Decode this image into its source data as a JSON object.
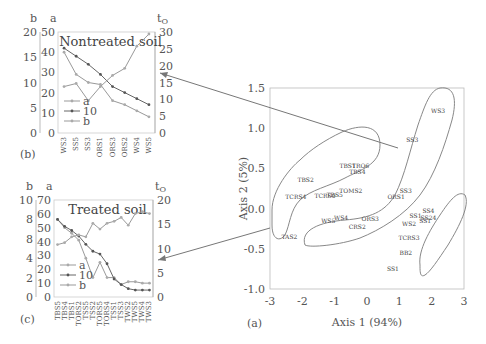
{
  "chart_data": [
    {
      "panel": "(b)",
      "type": "line",
      "title": "Nontreated soil",
      "categories": [
        "WS3",
        "SS5",
        "SS3",
        "ORS1",
        "ORS3",
        "ORS2",
        "WS4",
        "WS5"
      ],
      "axes": {
        "left_outer": {
          "label": "b",
          "range": [
            0,
            20
          ],
          "ticks": [
            0,
            5,
            10,
            15,
            20
          ]
        },
        "left_inner": {
          "label": "a",
          "range": [
            0,
            50
          ],
          "ticks": [
            0,
            10,
            20,
            30,
            40,
            50
          ]
        },
        "right": {
          "label": "tO",
          "range": [
            0,
            30
          ],
          "ticks": [
            0,
            5,
            10,
            15,
            20,
            25,
            30
          ]
        }
      },
      "series": [
        {
          "name": "a",
          "axis": "a",
          "values": [
            40,
            29,
            25,
            24,
            16,
            14,
            11,
            8
          ]
        },
        {
          "name": "10",
          "axis": "a",
          "values": [
            42,
            38,
            34,
            29,
            23,
            20,
            17,
            14
          ]
        },
        {
          "name": "b",
          "axis": "b",
          "values": [
            9.2,
            9.8,
            6.4,
            9.2,
            11.4,
            12.8,
            17.2,
            19.6
          ]
        }
      ],
      "legend": [
        "a",
        "10",
        "b"
      ],
      "legend_position": "lower-left"
    },
    {
      "panel": "(c)",
      "type": "line",
      "title": "Treated soil",
      "categories": [
        "TBS5",
        "TBS4",
        "TBS1",
        "TORS2",
        "TSS5",
        "TSS2",
        "TORS5",
        "TORS4",
        "TSS1",
        "TSS3",
        "TWS2",
        "TWS5",
        "TWS4",
        "TWS3"
      ],
      "axes": {
        "left_outer": {
          "label": "b",
          "range": [
            0,
            10
          ],
          "ticks": [
            0,
            2,
            4,
            8,
            8,
            10
          ]
        },
        "left_inner": {
          "label": "a",
          "range": [
            0,
            70
          ],
          "ticks": [
            0,
            10,
            20,
            30,
            40,
            50,
            60,
            70
          ]
        },
        "right": {
          "label": "tO",
          "range": [
            0,
            20
          ],
          "ticks": [
            0,
            5,
            10,
            15,
            20
          ]
        }
      },
      "series": [
        {
          "name": "a",
          "axis": "a",
          "values": [
            56,
            50,
            46,
            41,
            28,
            14,
            25,
            14,
            14,
            9,
            11,
            11,
            10,
            10
          ]
        },
        {
          "name": "10",
          "axis": "a",
          "values": [
            56,
            51,
            48,
            44,
            38,
            33,
            31,
            24,
            13,
            9,
            6,
            5,
            5,
            5
          ]
        },
        {
          "name": "b",
          "axis": "b",
          "values": [
            5.4,
            5.6,
            6.2,
            6.4,
            6.2,
            7.6,
            7.0,
            7.6,
            7.8,
            8.2,
            7.4,
            8.6,
            8.8,
            8.6
          ]
        }
      ],
      "legend": [
        "a",
        "10",
        "b"
      ],
      "legend_position": "lower-left"
    },
    {
      "panel": "(a)",
      "type": "scatter",
      "xlabel": "Axis 1 (94%)",
      "ylabel": "Axis 2 (5%)",
      "xlim": [
        -3,
        3
      ],
      "ylim": [
        -1.0,
        1.5
      ],
      "xticks": [
        -3,
        -2,
        -1,
        0,
        1,
        2,
        3
      ],
      "yticks": [
        "-1.0",
        "-0.5",
        "0.0",
        "0.5",
        "1.0",
        "1.5"
      ],
      "points": [
        {
          "label": "WS3",
          "x": 2.2,
          "y": 1.22
        },
        {
          "label": "SS3",
          "x": 1.4,
          "y": 0.85
        },
        {
          "label": "TBS1",
          "x": -0.6,
          "y": 0.53
        },
        {
          "label": "TRO6",
          "x": -0.2,
          "y": 0.53
        },
        {
          "label": "TBS4",
          "x": -0.3,
          "y": 0.45
        },
        {
          "label": "TBS2",
          "x": -1.9,
          "y": 0.35
        },
        {
          "label": "TOMS2",
          "x": -0.5,
          "y": 0.22
        },
        {
          "label": "TCRS4",
          "x": -2.2,
          "y": 0.14
        },
        {
          "label": "TCRS0",
          "x": -1.3,
          "y": 0.16
        },
        {
          "label": "TBS5",
          "x": -1.0,
          "y": 0.17
        },
        {
          "label": "ORS1",
          "x": 0.9,
          "y": 0.15
        },
        {
          "label": "SS3b",
          "x": 1.2,
          "y": 0.22
        },
        {
          "label": "WS5",
          "x": -1.2,
          "y": -0.15
        },
        {
          "label": "WS4",
          "x": -0.8,
          "y": -0.12
        },
        {
          "label": "ORS3",
          "x": 0.1,
          "y": -0.13
        },
        {
          "label": "CRS2",
          "x": -0.3,
          "y": -0.23
        },
        {
          "label": "TAS2",
          "x": -2.4,
          "y": -0.35
        },
        {
          "label": "SS4",
          "x": 1.9,
          "y": -0.03
        },
        {
          "label": "SS1",
          "x": 1.5,
          "y": -0.09
        },
        {
          "label": "SS24",
          "x": 1.9,
          "y": -0.12
        },
        {
          "label": "WS2",
          "x": 1.3,
          "y": -0.19
        },
        {
          "label": "SS1b",
          "x": 1.8,
          "y": -0.16
        },
        {
          "label": "TCRS3",
          "x": 1.3,
          "y": -0.37
        },
        {
          "label": "BB2",
          "x": 1.2,
          "y": -0.55
        },
        {
          "label": "SS1c",
          "x": 0.8,
          "y": -0.75
        }
      ]
    }
  ],
  "labels": {
    "panel_b": "(b)",
    "panel_c": "(c)",
    "panel_a": "(a)",
    "b_axis": "b",
    "a_axis": "a",
    "t_axis": "t",
    "t_sub": "O",
    "nontreated_title": "Nontreated soil",
    "treated_title": "Treated soil",
    "legend_a": "a",
    "legend_10": "10",
    "legend_b": "b",
    "scatter_xlabel": "Axis 1 (94%)",
    "scatter_ylabel": "Axis 2 (5%)"
  },
  "colors": {
    "line": "#8a8a8a",
    "axis": "#aaaaaa",
    "text": "#555555",
    "arrow": "#777777"
  }
}
